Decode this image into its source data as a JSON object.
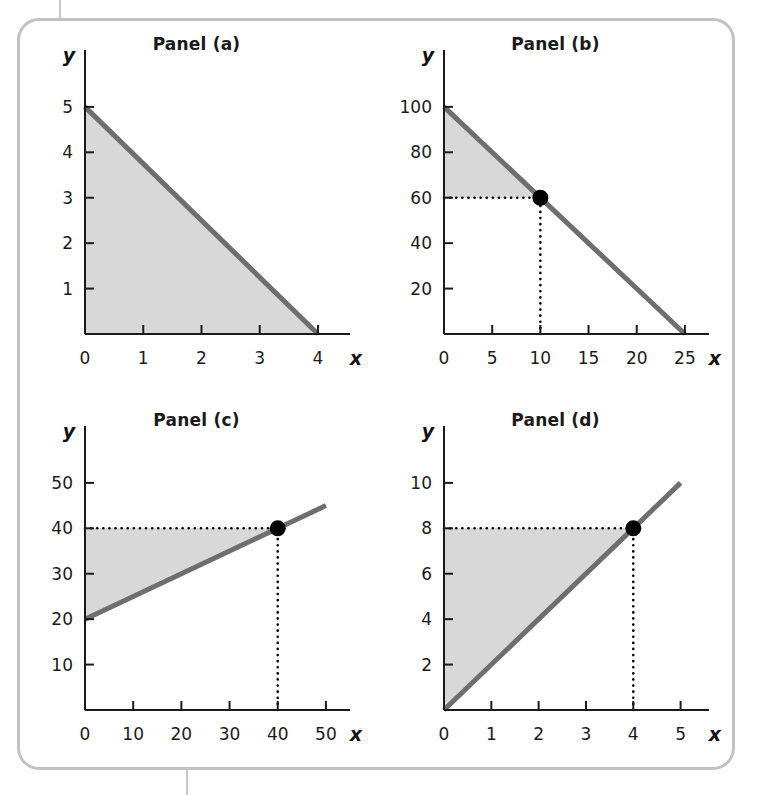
{
  "figure": {
    "background": "#ffffff",
    "frame_color": "#c2c2c2",
    "line_color": "#6e6e6e",
    "fill_color": "#d8d8d8",
    "axis_color": "#1a1a1a",
    "dot_color": "#000000"
  },
  "chart_data": [
    {
      "type": "line",
      "title": "Panel (a)",
      "xlabel": "x",
      "ylabel": "y",
      "xlim": [
        0,
        4.55
      ],
      "ylim": [
        0,
        5.9
      ],
      "xticks": [
        0,
        1,
        2,
        3,
        4
      ],
      "xtick_labels": [
        "0",
        "1",
        "2",
        "3",
        "4"
      ],
      "yticks": [
        1,
        2,
        3,
        4,
        5
      ],
      "ytick_labels": [
        "1",
        "2",
        "3",
        "4",
        "5"
      ],
      "grid": false,
      "legend": "none",
      "series": [
        {
          "name": "line-a",
          "points": [
            [
              0,
              5
            ],
            [
              4,
              0
            ]
          ],
          "intercept": 5,
          "slope": -1.25
        }
      ],
      "shaded_region": {
        "name": "triangle-under-line",
        "polygon": [
          [
            0,
            0
          ],
          [
            0,
            5
          ],
          [
            4,
            0
          ]
        ]
      },
      "markers": [],
      "dotted_guides": []
    },
    {
      "type": "line",
      "title": "Panel (b)",
      "xlabel": "x",
      "ylabel": "y",
      "xlim": [
        0,
        27.5
      ],
      "ylim": [
        0,
        118
      ],
      "xticks": [
        0,
        5,
        10,
        15,
        20,
        25
      ],
      "xtick_labels": [
        "0",
        "5",
        "10",
        "15",
        "20",
        "25"
      ],
      "yticks": [
        20,
        40,
        60,
        80,
        100
      ],
      "ytick_labels": [
        "20",
        "40",
        "60",
        "80",
        "100"
      ],
      "grid": false,
      "legend": "none",
      "series": [
        {
          "name": "line-b",
          "points": [
            [
              0,
              100
            ],
            [
              25,
              0
            ]
          ],
          "intercept": 100,
          "slope": -4
        }
      ],
      "shaded_region": {
        "name": "triangle-above-line",
        "polygon": [
          [
            0,
            60
          ],
          [
            0,
            100
          ],
          [
            10,
            60
          ]
        ]
      },
      "markers": [
        {
          "name": "point-b",
          "x": 10,
          "y": 60
        }
      ],
      "dotted_guides": [
        {
          "name": "horizontal-guide-y60",
          "from": [
            0,
            60
          ],
          "to": [
            10,
            60
          ]
        },
        {
          "name": "vertical-guide-x10",
          "from": [
            10,
            0
          ],
          "to": [
            10,
            60
          ]
        }
      ]
    },
    {
      "type": "line",
      "title": "Panel (c)",
      "xlabel": "x",
      "ylabel": "y",
      "xlim": [
        0,
        55
      ],
      "ylim": [
        0,
        59
      ],
      "xticks": [
        0,
        10,
        20,
        30,
        40,
        50
      ],
      "xtick_labels": [
        "0",
        "10",
        "20",
        "30",
        "40",
        "50"
      ],
      "yticks": [
        10,
        20,
        30,
        40,
        50
      ],
      "ytick_labels": [
        "10",
        "20",
        "30",
        "40",
        "50"
      ],
      "grid": false,
      "legend": "none",
      "series": [
        {
          "name": "line-c",
          "points": [
            [
              0,
              20
            ],
            [
              50,
              45
            ]
          ],
          "intercept": 20,
          "slope": 0.5
        }
      ],
      "shaded_region": {
        "name": "wedge-between-line-and-y40",
        "polygon": [
          [
            0,
            20
          ],
          [
            0,
            40
          ],
          [
            40,
            40
          ]
        ]
      },
      "markers": [
        {
          "name": "point-c",
          "x": 40,
          "y": 40
        }
      ],
      "dotted_guides": [
        {
          "name": "horizontal-guide-y40",
          "from": [
            0,
            40
          ],
          "to": [
            40,
            40
          ]
        },
        {
          "name": "vertical-guide-x40",
          "from": [
            40,
            0
          ],
          "to": [
            40,
            40
          ]
        }
      ]
    },
    {
      "type": "line",
      "title": "Panel (d)",
      "xlabel": "x",
      "ylabel": "y",
      "xlim": [
        0,
        5.6
      ],
      "ylim": [
        0,
        11.8
      ],
      "xticks": [
        0,
        1,
        2,
        3,
        4,
        5
      ],
      "xtick_labels": [
        "0",
        "1",
        "2",
        "3",
        "4",
        "5"
      ],
      "yticks": [
        2,
        4,
        6,
        8,
        10
      ],
      "ytick_labels": [
        "2",
        "4",
        "6",
        "8",
        "10"
      ],
      "grid": false,
      "legend": "none",
      "series": [
        {
          "name": "line-d",
          "points": [
            [
              0,
              0
            ],
            [
              5,
              10
            ]
          ],
          "intercept": 0,
          "slope": 2
        }
      ],
      "shaded_region": {
        "name": "triangle-above-line-below-y8",
        "polygon": [
          [
            0,
            0
          ],
          [
            0,
            8
          ],
          [
            4,
            8
          ]
        ]
      },
      "markers": [
        {
          "name": "point-d",
          "x": 4,
          "y": 8
        }
      ],
      "dotted_guides": [
        {
          "name": "horizontal-guide-y8",
          "from": [
            0,
            8
          ],
          "to": [
            4,
            8
          ]
        },
        {
          "name": "vertical-guide-x4",
          "from": [
            4,
            0
          ],
          "to": [
            4,
            8
          ]
        }
      ]
    }
  ]
}
